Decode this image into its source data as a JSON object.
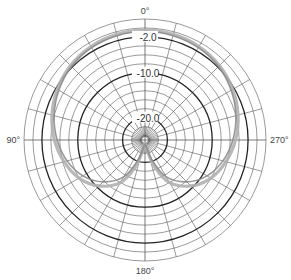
{
  "chart_data": {
    "type": "polar-line",
    "title": "",
    "angle_unit": "degrees",
    "angle_direction": "counterclockwise-from-top",
    "angle_labels": [
      {
        "angle": 0,
        "text": "0°"
      },
      {
        "angle": 90,
        "text": "90°"
      },
      {
        "angle": 180,
        "text": "180°"
      },
      {
        "angle": 270,
        "text": "270°"
      }
    ],
    "radial_unit": "dB",
    "radial_range": [
      -25,
      2
    ],
    "radial_rings_dB": [
      2,
      0,
      -2,
      -4,
      -6,
      -8,
      -10,
      -12,
      -14,
      -16,
      -18,
      -20,
      -22,
      -24
    ],
    "major_rings_dB": [
      -2,
      -10,
      -20
    ],
    "ring_labels": [
      {
        "value": -2,
        "text": "-2.0"
      },
      {
        "value": -10,
        "text": "-10.0"
      },
      {
        "value": -20,
        "text": "-20.0"
      }
    ],
    "spoke_step_deg": 15,
    "colors": {
      "grid": "#555555",
      "major_ring": "#222222",
      "trace_outer": "#b0b0b0",
      "trace_inner": "#8c8c8c"
    },
    "series": [
      {
        "name": "trace-1",
        "angles": [
          0,
          15,
          30,
          45,
          60,
          75,
          90,
          105,
          120,
          135,
          150,
          160,
          170,
          180,
          190,
          200,
          210,
          225,
          240,
          255,
          270,
          285,
          300,
          315,
          330,
          345,
          360
        ],
        "values_dB": [
          -0.5,
          -0.6,
          -0.9,
          -1.5,
          -2.4,
          -3.5,
          -4.8,
          -6.3,
          -8.0,
          -10.5,
          -14.0,
          -18.5,
          -23.0,
          -24.5,
          -23.0,
          -18.5,
          -14.0,
          -10.5,
          -8.0,
          -6.3,
          -4.8,
          -3.5,
          -2.4,
          -1.5,
          -0.9,
          -0.6,
          -0.5
        ]
      },
      {
        "name": "trace-2",
        "angles": [
          0,
          15,
          30,
          45,
          60,
          75,
          90,
          105,
          120,
          135,
          150,
          160,
          170,
          180,
          190,
          200,
          210,
          225,
          240,
          255,
          270,
          285,
          300,
          315,
          330,
          345,
          360
        ],
        "values_dB": [
          -0.8,
          -0.9,
          -1.2,
          -1.8,
          -2.8,
          -4.0,
          -5.4,
          -7.0,
          -9.0,
          -11.8,
          -15.5,
          -20.0,
          -23.5,
          -24.0,
          -23.5,
          -20.0,
          -15.5,
          -11.8,
          -9.0,
          -7.0,
          -5.4,
          -4.0,
          -2.8,
          -1.8,
          -1.2,
          -0.9,
          -0.8
        ]
      }
    ]
  }
}
